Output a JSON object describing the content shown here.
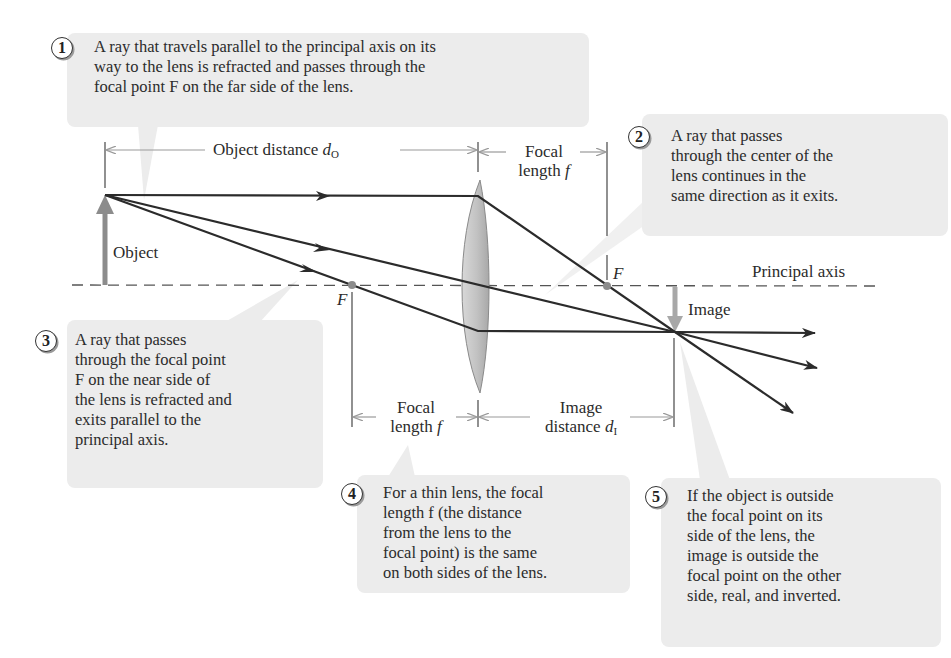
{
  "figure": {
    "callouts": [
      {
        "number": "1",
        "text": "A ray that travels parallel to the principal axis on its\nway to the lens is refracted and passes through the\nfocal point F on the far side of the lens."
      },
      {
        "number": "2",
        "text": "A ray that passes\nthrough the center of the\nlens continues in the\nsame direction as it exits."
      },
      {
        "number": "3",
        "text": "A ray that passes\nthrough the focal point\nF on the near side of\nthe lens is refracted and\nexits parallel to the\nprincipal axis."
      },
      {
        "number": "4",
        "text": "For a thin lens, the focal\nlength f (the distance\nfrom the lens to the\nfocal point) is the same\non both sides of the lens."
      },
      {
        "number": "5",
        "text": "If the object is outside\nthe focal point on its\nside of the lens, the\nimage is outside the\nfocal point on the other\nside, real, and inverted."
      }
    ],
    "labels": {
      "object_distance": "Object distance",
      "object_distance_symbol": "d",
      "object_distance_sub": "O",
      "focal_length_top_line1": "Focal",
      "focal_length_top_line2": "length",
      "focal_symbol": "f",
      "focal_length_bottom_line1": "Focal",
      "focal_length_bottom_line2": "length",
      "image_distance_line1": "Image",
      "image_distance_line2": "distance",
      "image_distance_symbol": "d",
      "image_distance_sub": "I",
      "object": "Object",
      "image": "Image",
      "principal_axis": "Principal axis",
      "focal_point_left": "F",
      "focal_point_right": "F"
    },
    "colors": {
      "callout_bg": "#ececec",
      "ray": "#2b2b2b",
      "arrow_gray": "#8c8c8c",
      "lens_fill": "#c9c9c9",
      "dimension_line": "#9a9a9a"
    }
  }
}
